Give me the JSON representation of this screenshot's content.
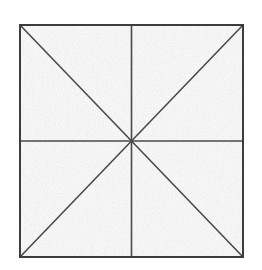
{
  "figure": {
    "kind": "geometric-diagram",
    "canvas": {
      "width": 262,
      "height": 270,
      "background_color": "#ffffff"
    },
    "square": {
      "label": "outer-square",
      "left": 20,
      "top": 25,
      "right": 243,
      "bottom": 257,
      "width": 223,
      "height": 232,
      "fill_color": "#e9e9e9",
      "stroke_color": "#3c3c3c",
      "stroke_width": 2
    },
    "center_point": {
      "label": "center",
      "x": 131.5,
      "y": 141
    },
    "corners": [
      {
        "label": "top-left",
        "x": 20,
        "y": 25
      },
      {
        "label": "top-right",
        "x": 243,
        "y": 25
      },
      {
        "label": "bottom-right",
        "x": 243,
        "y": 257
      },
      {
        "label": "bottom-left",
        "x": 20,
        "y": 257
      }
    ],
    "edge_midpoints": [
      {
        "label": "top-mid",
        "x": 131.5,
        "y": 25
      },
      {
        "label": "right-mid",
        "x": 243,
        "y": 141
      },
      {
        "label": "bottom-mid",
        "x": 131.5,
        "y": 257
      },
      {
        "label": "left-mid",
        "x": 20,
        "y": 141
      }
    ],
    "interior_lines": [
      {
        "label": "vertical-median",
        "x1": 131.5,
        "y1": 25,
        "x2": 131.5,
        "y2": 257,
        "stroke_color": "#4a4a4a",
        "stroke_width": 1.6
      },
      {
        "label": "horizontal-median",
        "x1": 20,
        "y1": 141,
        "x2": 243,
        "y2": 141,
        "stroke_color": "#4a4a4a",
        "stroke_width": 1.6
      },
      {
        "label": "diagonal-tl-br",
        "x1": 20,
        "y1": 25,
        "x2": 243,
        "y2": 257,
        "stroke_color": "#4a4a4a",
        "stroke_width": 1.6
      },
      {
        "label": "diagonal-tr-bl",
        "x1": 243,
        "y1": 25,
        "x2": 20,
        "y2": 257,
        "stroke_color": "#4a4a4a",
        "stroke_width": 1.6
      }
    ],
    "texture": {
      "style": "scanned-paper-grain",
      "base_color": "#ececec",
      "speckle_light": "#f8f8f8",
      "speckle_dark": "#d2d2d2",
      "opacity": 0.85
    },
    "region_count": 8
  }
}
